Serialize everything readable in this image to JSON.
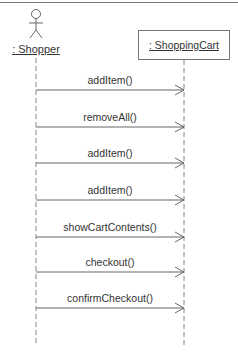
{
  "diagram": {
    "type": "UML sequence diagram",
    "actor": {
      "label": ": Shopper",
      "x": 36
    },
    "object": {
      "label": ": ShoppingCart",
      "x": 184
    },
    "messages": [
      {
        "label": "addItem()",
        "y": 90
      },
      {
        "label": "removeAll()",
        "y": 127
      },
      {
        "label": "addItem()",
        "y": 163
      },
      {
        "label": "addItem()",
        "y": 200
      },
      {
        "label": "showCartContents()",
        "y": 237
      },
      {
        "label": "checkout()",
        "y": 272
      },
      {
        "label": "confirmCheckout()",
        "y": 308
      }
    ],
    "colors": {
      "line": "#777777",
      "text": "#333333",
      "background": "#ffffff"
    }
  }
}
